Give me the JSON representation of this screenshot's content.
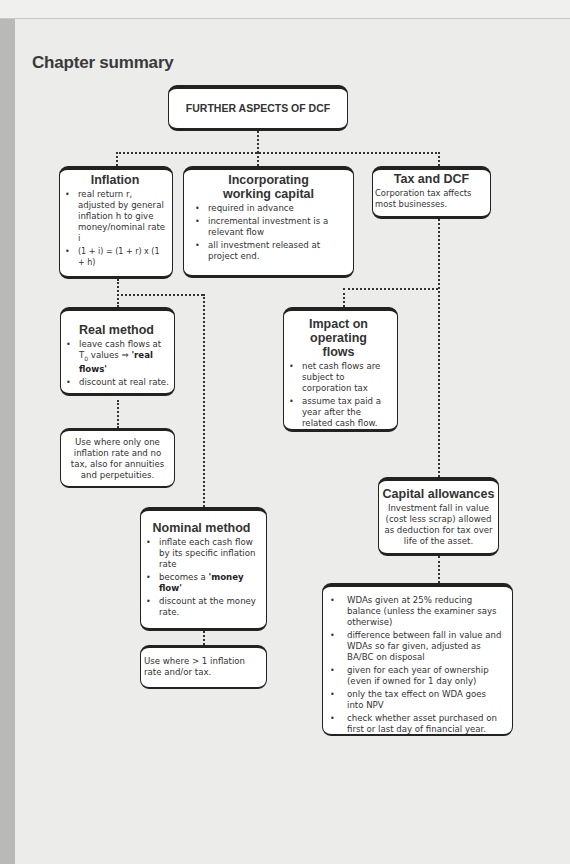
{
  "title": "Chapter summary",
  "root": {
    "label": "FURTHER ASPECTS OF DCF"
  },
  "inflation": {
    "heading": "Inflation",
    "bullets": [
      "real return r, adjusted by general inflation h to give money/nominal rate i",
      "(1 + i) = (1 + r) x (1 + h)"
    ]
  },
  "working_capital": {
    "heading": "Incorporating working capital",
    "bullets": [
      "required in advance",
      "incremental investment is a relevant flow",
      "all investment released at project end."
    ]
  },
  "tax": {
    "heading": "Tax and DCF",
    "text": "Corporation tax affects most businesses."
  },
  "real_method": {
    "heading": "Real method",
    "bullet1_pre": "leave cash flows at T",
    "bullet1_sub": "0",
    "bullet1_mid": " values ⇒ ",
    "bullet1_bold": "'real flows'",
    "bullet2": "discount at real rate."
  },
  "real_use": {
    "text": "Use where only one inflation rate and no tax, also for annuities and perpetuities."
  },
  "nominal_method": {
    "heading": "Nominal method",
    "bullet1": "inflate each cash flow by its specific inflation rate",
    "bullet2_pre": "becomes a ",
    "bullet2_bold": "'money flow'",
    "bullet3": "discount at the money rate."
  },
  "nominal_use": {
    "text": "Use where > 1 inflation rate and/or tax."
  },
  "operating_flows": {
    "heading": "Impact on operating flows",
    "bullets": [
      "net cash flows are subject to corporation tax",
      "assume tax paid a year after the related cash flow."
    ]
  },
  "capital_allowances": {
    "heading": "Capital allowances",
    "text": "Investment fall in value (cost less scrap) allowed as deduction for tax over life of the asset."
  },
  "wda": {
    "bullets": [
      "WDAs given at 25% reducing balance (unless the examiner says otherwise)",
      "difference between fall in value and WDAs so far given, adjusted as BA/BC on disposal",
      "given for each year of ownership (even if owned for 1 day only)",
      "only the tax effect on WDA goes into NPV",
      "check whether asset purchased on first or last day of financial year."
    ]
  }
}
